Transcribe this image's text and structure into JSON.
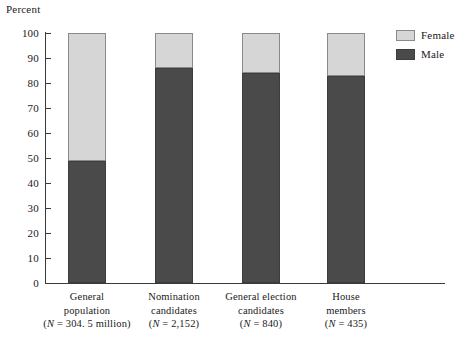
{
  "chart_data": {
    "type": "bar",
    "subtype": "stacked-percentage",
    "title": "",
    "ylabel": "Percent",
    "xlabel": "",
    "ylim": [
      0,
      100
    ],
    "ytick_interval": 10,
    "yticks": [
      100,
      90,
      80,
      70,
      60,
      50,
      40,
      30,
      20,
      10,
      0
    ],
    "ytick_labels": [
      "100",
      "90",
      "80",
      "70",
      "60",
      "50",
      "40",
      "30",
      "20",
      "10",
      "0"
    ],
    "grid": false,
    "legend_position": "right",
    "categories": [
      "General population",
      "Nomination candidates",
      "General election candidates",
      "House members"
    ],
    "category_lines": [
      [
        "General",
        "population",
        "(N = 304. 5 million)"
      ],
      [
        "Nomination",
        "candidates",
        "(N = 2,152)"
      ],
      [
        "General election",
        "candidates",
        "(N = 840)"
      ],
      [
        "House",
        "members",
        "(N = 435)"
      ]
    ],
    "sample_sizes": [
      "304. 5 million",
      "2,152",
      "840",
      "435"
    ],
    "series": [
      {
        "name": "Male",
        "color": "#4a4a4a",
        "values": [
          49,
          86,
          84,
          83
        ]
      },
      {
        "name": "Female",
        "color": "#d6d6d6",
        "values": [
          51,
          14,
          16,
          17
        ]
      }
    ],
    "legend_entries": [
      {
        "label": "Female",
        "color": "#d6d6d6"
      },
      {
        "label": "Male",
        "color": "#4a4a4a"
      }
    ]
  },
  "legend": {
    "items": [
      {
        "label": "Female",
        "swatch": "female-swatch"
      },
      {
        "label": "Male",
        "swatch": "male-swatch"
      }
    ]
  },
  "colors": {
    "female": "#d6d6d6",
    "male": "#4a4a4a",
    "axis": "#3a3a3a",
    "background": "#ffffff"
  }
}
